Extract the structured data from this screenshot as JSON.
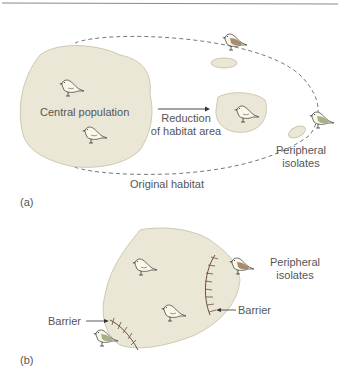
{
  "panel_a": {
    "label": "(a)",
    "central_population": "Central population",
    "arrow_label_1": "Reduction",
    "arrow_label_2": "of habitat area",
    "peripheral_1": "Peripheral",
    "peripheral_2": "isolates",
    "original_habitat": "Original habitat"
  },
  "panel_b": {
    "label": "(b)",
    "peripheral_1": "Peripheral",
    "peripheral_2": "isolates",
    "barrier_left": "Barrier",
    "barrier_right": "Barrier"
  },
  "colors": {
    "habitat_fill": "#ebe7d6",
    "habitat_stroke": "#cfc8b0",
    "bird_brown": "#a88a6e",
    "bird_green": "#a8b08a",
    "barrier": "#6b4e3a",
    "text": "#555555"
  }
}
